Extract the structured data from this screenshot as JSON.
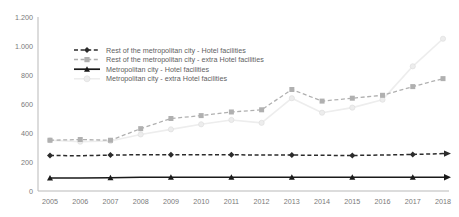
{
  "chart_data": {
    "type": "line",
    "title": "",
    "subtitle": "",
    "xlabel": "",
    "ylabel": "",
    "categories": [
      "2005",
      "2006",
      "2007",
      "2008",
      "2009",
      "2010",
      "2011",
      "2012",
      "2013",
      "2014",
      "2015",
      "2016",
      "2017",
      "2018"
    ],
    "x_tick_labels": [
      "2005",
      "2006",
      "2007",
      "2008",
      "2009",
      "2010",
      "2011",
      "2012",
      "2013",
      "2014",
      "2015",
      "2016",
      "2017",
      "2018"
    ],
    "y_tick_labels": [
      "0",
      "200",
      "400",
      "600",
      "800",
      "1.000",
      "1.200"
    ],
    "y_tick_values": [
      0,
      200,
      400,
      600,
      800,
      1000,
      1200
    ],
    "ylim": [
      0,
      1200
    ],
    "grid": false,
    "legend_position": "upper-left-inside",
    "series": [
      {
        "name": "Rest of the metropolitan city - Hotel facilities",
        "color": "#2b2b2b",
        "line_style": "dashed",
        "marker": "diamond",
        "end_arrow": true,
        "values": [
          245,
          243,
          248,
          250,
          250,
          250,
          250,
          248,
          248,
          246,
          245,
          248,
          252,
          258
        ]
      },
      {
        "name": "Rest of the metropolitan city - extra Hotel facilities",
        "color": "#b0b0b0",
        "line_style": "dashed",
        "marker": "square",
        "end_arrow": false,
        "values": [
          350,
          355,
          350,
          430,
          500,
          520,
          545,
          560,
          700,
          620,
          640,
          660,
          720,
          775
        ]
      },
      {
        "name": "Metropolitan city - Hotel facilities",
        "color": "#1a1a1a",
        "line_style": "solid",
        "marker": "triangle",
        "end_arrow": true,
        "values": [
          90,
          90,
          92,
          95,
          95,
          95,
          95,
          95,
          95,
          95,
          95,
          95,
          95,
          95
        ]
      },
      {
        "name": "Metropolitan city - extra Hotel facilities",
        "color": "#ededed",
        "line_style": "solid",
        "marker": "circle",
        "end_arrow": false,
        "values": [
          350,
          340,
          345,
          390,
          425,
          460,
          490,
          470,
          640,
          540,
          575,
          630,
          860,
          1050
        ]
      }
    ]
  },
  "legend": {
    "items": [
      {
        "label": "Rest of the metropolitan city - Hotel facilities"
      },
      {
        "label": "Rest of the metropolitan city - extra Hotel facilities"
      },
      {
        "label": "Metropolitan city - Hotel facilities"
      },
      {
        "label": "Metropolitan city - extra Hotel facilities"
      }
    ]
  }
}
